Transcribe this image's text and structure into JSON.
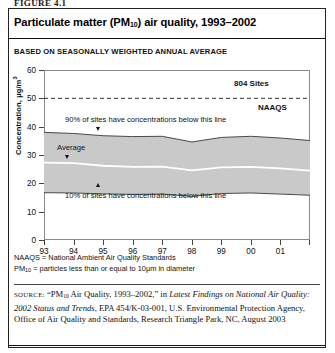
{
  "figure_number": "FIGURE 4.1",
  "title_prefix": "Particulate matter (PM",
  "title_sub": "10",
  "title_suffix": ") air quality, 1993–2002",
  "subtitle": "BASED ON SEASONALLY WEIGHTED ANNUAL AVERAGE",
  "annotations": {
    "sites": "804 Sites",
    "naaqs": "NAAQS",
    "p90": "90% of sites have concentrations below this line",
    "average": "Average",
    "p10": "10% of sites have concentrations below this line"
  },
  "notes": {
    "line1": "NAAQS = National Ambient Air Quality Standards",
    "line2_prefix": "PM",
    "line2_sub": "10",
    "line2_suffix": " = particles less than or equal to 10µm in diameter"
  },
  "source": {
    "label": "SOURCE:",
    "t1": " “PM",
    "sub1": "10",
    "t2": " Air Quality, 1993–2002,” in ",
    "italic1": "Latest Findings on National Air Quality: 2002 Status and Trends",
    "t3": ", EPA 454/K-03-001, U.S. Environmental Protection Agency, Office of Air Quality and Standards, Research Triangle Park, NC, August 2003"
  },
  "colors": {
    "band_fill": "#c9c9c9",
    "band_edge": "#4a4a4a",
    "average_line": "#ffffff",
    "naaqs_line": "#333333",
    "frame": "#8a8a8a",
    "text": "#111111"
  },
  "chart_data": {
    "type": "area",
    "title": "Particulate matter (PM10) air quality, 1993–2002",
    "subtitle": "BASED ON SEASONALLY WEIGHTED ANNUAL AVERAGE",
    "xlabel": "",
    "ylabel": "Concentration, µg/m3",
    "ylim": [
      0,
      60
    ],
    "yticks": [
      0,
      10,
      20,
      30,
      40,
      50,
      60
    ],
    "xlim": [
      1993,
      2002
    ],
    "x": [
      1993,
      1994,
      1995,
      1996,
      1997,
      1998,
      1999,
      2000,
      2001,
      2002
    ],
    "xticklabels": [
      "93",
      "94",
      "95",
      "96",
      "97",
      "98",
      "99",
      "00",
      "01",
      ""
    ],
    "grid": false,
    "legend": "none",
    "series": [
      {
        "name": "90th percentile",
        "values": [
          38.0,
          37.6,
          36.8,
          36.5,
          36.6,
          34.6,
          36.2,
          36.6,
          36.0,
          35.1
        ]
      },
      {
        "name": "Average",
        "values": [
          27.3,
          27.1,
          26.2,
          25.8,
          25.9,
          24.6,
          25.6,
          25.8,
          25.3,
          24.5
        ]
      },
      {
        "name": "10th percentile",
        "values": [
          16.7,
          16.6,
          16.3,
          16.1,
          16.2,
          15.4,
          16.4,
          16.6,
          16.2,
          15.8
        ]
      }
    ],
    "reference_lines": [
      {
        "name": "NAAQS",
        "value": 50,
        "style": "dashed",
        "label": "NAAQS"
      }
    ],
    "annotations": [
      {
        "text": "804 Sites",
        "bold": true
      },
      {
        "text": "90% of sites have concentrations below this line"
      },
      {
        "text": "Average"
      },
      {
        "text": "10% of sites have concentrations below this line"
      }
    ]
  }
}
